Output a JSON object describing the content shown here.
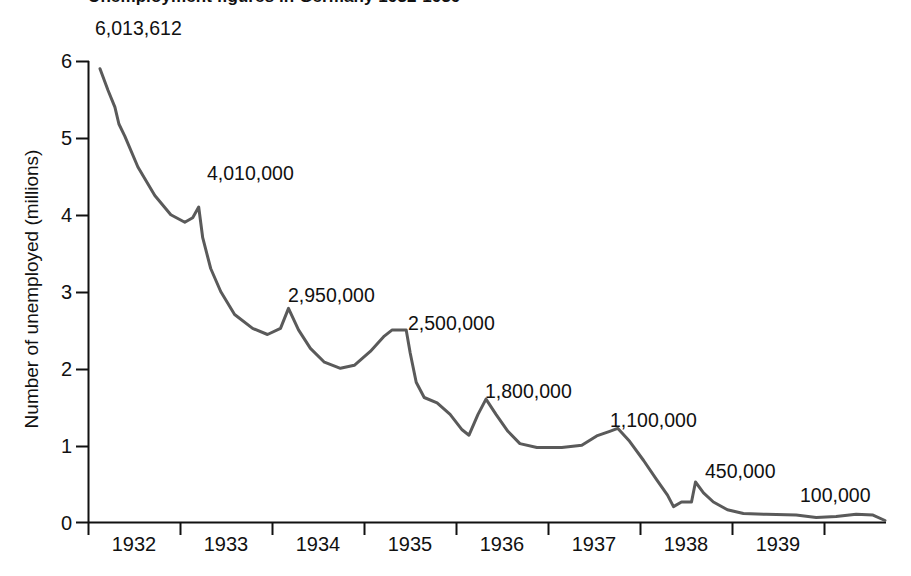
{
  "chart_data": {
    "type": "line",
    "title": "Unemployment figures in Germany 1932-1939",
    "xlabel": "",
    "ylabel": "Number of unemployed (millions)",
    "ylim": [
      0,
      6
    ],
    "xlim": [
      1931.75,
      1939.75
    ],
    "grid": false,
    "legend": "none",
    "y_ticks": [
      "0",
      "1",
      "2",
      "3",
      "4",
      "5",
      "6"
    ],
    "x_ticks": [
      "1932",
      "1933",
      "1934",
      "1935",
      "1936",
      "1937",
      "1938",
      "1939"
    ],
    "line_color": "#5a5a5a",
    "axis_color": "#111111",
    "annotations": [
      {
        "label": "6,013,612",
        "value": 6013612,
        "x": 1931.9
      },
      {
        "label": "4,010,000",
        "value": 4010000,
        "x": 1932.85
      },
      {
        "label": "2,950,000",
        "value": 2950000,
        "x": 1933.7
      },
      {
        "label": "2,500,000",
        "value": 2500000,
        "x": 1934.6
      },
      {
        "label": "1,800,000",
        "value": 1800000,
        "x": 1935.6
      },
      {
        "label": "1,100,000",
        "value": 1100000,
        "x": 1936.9
      },
      {
        "label": "450,000",
        "value": 450000,
        "x": 1937.9
      },
      {
        "label": "100,000",
        "value": 100000,
        "x": 1939.2
      }
    ],
    "series": [
      {
        "name": "Number of unemployed (millions)",
        "points": [
          [
            1931.87,
            5.9
          ],
          [
            1931.95,
            5.62
          ],
          [
            1932.02,
            5.4
          ],
          [
            1932.06,
            5.18
          ],
          [
            1932.12,
            5.02
          ],
          [
            1932.25,
            4.62
          ],
          [
            1932.42,
            4.25
          ],
          [
            1932.58,
            4.0
          ],
          [
            1932.72,
            3.9
          ],
          [
            1932.8,
            3.96
          ],
          [
            1932.86,
            4.1
          ],
          [
            1932.9,
            3.7
          ],
          [
            1932.98,
            3.3
          ],
          [
            1933.08,
            3.0
          ],
          [
            1933.22,
            2.7
          ],
          [
            1933.4,
            2.52
          ],
          [
            1933.55,
            2.44
          ],
          [
            1933.68,
            2.52
          ],
          [
            1933.76,
            2.78
          ],
          [
            1933.86,
            2.5
          ],
          [
            1933.98,
            2.26
          ],
          [
            1934.12,
            2.08
          ],
          [
            1934.28,
            2.0
          ],
          [
            1934.42,
            2.04
          ],
          [
            1934.58,
            2.22
          ],
          [
            1934.72,
            2.42
          ],
          [
            1934.8,
            2.5
          ],
          [
            1934.94,
            2.5
          ],
          [
            1934.98,
            2.2
          ],
          [
            1935.04,
            1.82
          ],
          [
            1935.12,
            1.62
          ],
          [
            1935.25,
            1.55
          ],
          [
            1935.38,
            1.4
          ],
          [
            1935.5,
            1.2
          ],
          [
            1935.57,
            1.13
          ],
          [
            1935.66,
            1.4
          ],
          [
            1935.74,
            1.6
          ],
          [
            1935.84,
            1.4
          ],
          [
            1935.96,
            1.18
          ],
          [
            1936.08,
            1.02
          ],
          [
            1936.25,
            0.97
          ],
          [
            1936.5,
            0.97
          ],
          [
            1936.7,
            1.0
          ],
          [
            1936.85,
            1.12
          ],
          [
            1936.98,
            1.18
          ],
          [
            1937.06,
            1.22
          ],
          [
            1937.18,
            1.05
          ],
          [
            1937.32,
            0.8
          ],
          [
            1937.45,
            0.55
          ],
          [
            1937.56,
            0.35
          ],
          [
            1937.62,
            0.2
          ],
          [
            1937.7,
            0.26
          ],
          [
            1937.8,
            0.26
          ],
          [
            1937.84,
            0.52
          ],
          [
            1937.92,
            0.38
          ],
          [
            1938.02,
            0.26
          ],
          [
            1938.16,
            0.16
          ],
          [
            1938.32,
            0.11
          ],
          [
            1938.55,
            0.1
          ],
          [
            1938.85,
            0.09
          ],
          [
            1939.05,
            0.06
          ],
          [
            1939.25,
            0.07
          ],
          [
            1939.45,
            0.1
          ],
          [
            1939.62,
            0.09
          ],
          [
            1939.74,
            0.02
          ]
        ]
      }
    ]
  }
}
